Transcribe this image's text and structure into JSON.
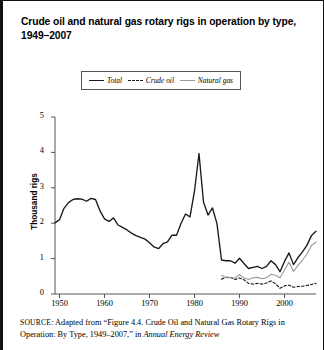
{
  "figure": {
    "title": "Crude oil and natural gas rotary rigs in operation by type, 1949–2007",
    "source_prefix": "SOURCE",
    "source_text_1": ": Adapted from “Figure 4.4. Crude Oil and Natural Gas Rotary Rigs  in Operation: By Type, 1949–2007,” in ",
    "source_italic": "Annual Energy Review"
  },
  "legend": {
    "position": "top-center",
    "items": [
      {
        "label": "Total",
        "style": "solid",
        "color": "#1a1a1a"
      },
      {
        "label": "Crude oil",
        "style": "dashed",
        "color": "#1a1a1a"
      },
      {
        "label": "Natural gas",
        "style": "solid-thin",
        "color": "#9a9a9a"
      }
    ]
  },
  "chart_data": {
    "type": "line",
    "title": "Crude oil and natural gas rotary rigs in operation by type, 1949–2007",
    "xlabel": "",
    "ylabel": "Thousand rigs",
    "xlim": [
      1949,
      2007
    ],
    "ylim": [
      0,
      5
    ],
    "yticks": [
      0,
      1,
      2,
      3,
      4,
      5
    ],
    "xticks": [
      1950,
      1960,
      1970,
      1980,
      1990,
      2000
    ],
    "grid": false,
    "units": "thousand rigs",
    "x": [
      1949,
      1950,
      1951,
      1952,
      1953,
      1954,
      1955,
      1956,
      1957,
      1958,
      1959,
      1960,
      1961,
      1962,
      1963,
      1964,
      1965,
      1966,
      1967,
      1968,
      1969,
      1970,
      1971,
      1972,
      1973,
      1974,
      1975,
      1976,
      1977,
      1978,
      1979,
      1980,
      1981,
      1982,
      1983,
      1984,
      1985,
      1986,
      1987,
      1988,
      1989,
      1990,
      1991,
      1992,
      1993,
      1994,
      1995,
      1996,
      1997,
      1998,
      1999,
      2000,
      2001,
      2002,
      2003,
      2004,
      2005,
      2006,
      2007
    ],
    "series": [
      {
        "name": "Total",
        "style": "solid",
        "color": "#1a1a1a",
        "values": [
          2.01,
          2.1,
          2.42,
          2.58,
          2.67,
          2.69,
          2.68,
          2.62,
          2.7,
          2.67,
          2.35,
          2.12,
          2.05,
          2.15,
          1.95,
          1.88,
          1.81,
          1.72,
          1.65,
          1.6,
          1.55,
          1.45,
          1.33,
          1.28,
          1.42,
          1.47,
          1.66,
          1.66,
          1.99,
          2.26,
          2.18,
          2.91,
          3.97,
          2.6,
          2.23,
          2.43,
          1.98,
          0.96,
          0.94,
          0.94,
          0.87,
          1.01,
          0.86,
          0.72,
          0.75,
          0.78,
          0.72,
          0.78,
          0.94,
          0.83,
          0.63,
          0.92,
          1.16,
          0.83,
          1.03,
          1.19,
          1.38,
          1.65,
          1.77
        ]
      },
      {
        "name": "Crude oil",
        "style": "dashed",
        "color": "#1a1a1a",
        "values": [
          null,
          null,
          null,
          null,
          null,
          null,
          null,
          null,
          null,
          null,
          null,
          null,
          null,
          null,
          null,
          null,
          null,
          null,
          null,
          null,
          null,
          null,
          null,
          null,
          null,
          null,
          null,
          null,
          null,
          null,
          null,
          null,
          null,
          null,
          null,
          null,
          null,
          0.42,
          0.47,
          0.47,
          0.41,
          0.45,
          0.4,
          0.3,
          0.28,
          0.3,
          0.28,
          0.31,
          0.37,
          0.29,
          0.16,
          0.23,
          0.25,
          0.19,
          0.21,
          0.22,
          0.24,
          0.27,
          0.3
        ]
      },
      {
        "name": "Natural gas",
        "style": "solid-thin",
        "color": "#9a9a9a",
        "values": [
          null,
          null,
          null,
          null,
          null,
          null,
          null,
          null,
          null,
          null,
          null,
          null,
          null,
          null,
          null,
          null,
          null,
          null,
          null,
          null,
          null,
          null,
          null,
          null,
          null,
          null,
          null,
          null,
          null,
          null,
          null,
          null,
          null,
          null,
          null,
          null,
          null,
          0.53,
          0.46,
          0.46,
          0.45,
          0.55,
          0.45,
          0.41,
          0.46,
          0.47,
          0.43,
          0.46,
          0.56,
          0.53,
          0.46,
          0.68,
          0.9,
          0.64,
          0.81,
          0.96,
          1.13,
          1.37,
          1.47
        ]
      }
    ]
  },
  "axes": {
    "y_tick_labels": [
      "0",
      "1",
      "2",
      "3",
      "4",
      "5"
    ],
    "x_tick_labels": [
      "1950",
      "1960",
      "1970",
      "1980",
      "1990",
      "2000"
    ],
    "y_axis_title": "Thousand rigs"
  }
}
